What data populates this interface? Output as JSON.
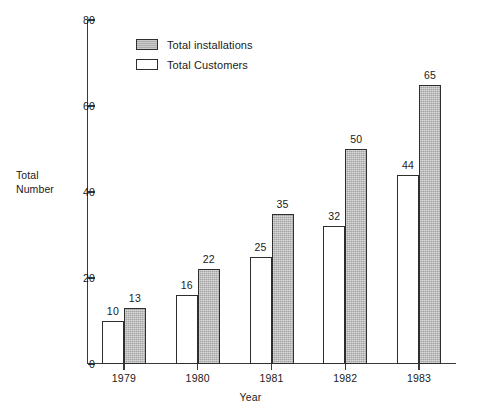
{
  "chart_data": {
    "type": "bar",
    "title": "",
    "subtitle": "",
    "xlabel": "Year",
    "ylabel": "Total Number",
    "categories": [
      "1979",
      "1980",
      "1981",
      "1982",
      "1983"
    ],
    "series": [
      {
        "name": "Total Customers",
        "key": "customers",
        "style": "white",
        "color": "#ffffff",
        "values": [
          10,
          16,
          25,
          32,
          44
        ]
      },
      {
        "name": "Total installations",
        "key": "installations",
        "style": "shaded",
        "color": "#b7b7b7",
        "values": [
          13,
          22,
          35,
          50,
          65
        ]
      }
    ],
    "ylim": [
      0,
      80
    ],
    "yticks": [
      0,
      20,
      40,
      60,
      80
    ],
    "ytick_labels": [
      "0",
      "20",
      "40",
      "60",
      "80"
    ],
    "grid": false,
    "legend_position": "top-left-inside",
    "legend_order": [
      "Total installations",
      "Total Customers"
    ],
    "bar_value_labels": true,
    "axis_color": "#2e2e2e",
    "background": "#ffffff"
  },
  "legend": {
    "items": [
      {
        "label": "Total installations",
        "swatch": "shaded"
      },
      {
        "label": "Total Customers",
        "swatch": "white"
      }
    ]
  },
  "axes": {
    "y_title_line1": "Total",
    "y_title_line2": "Number",
    "x_title": "Year"
  }
}
